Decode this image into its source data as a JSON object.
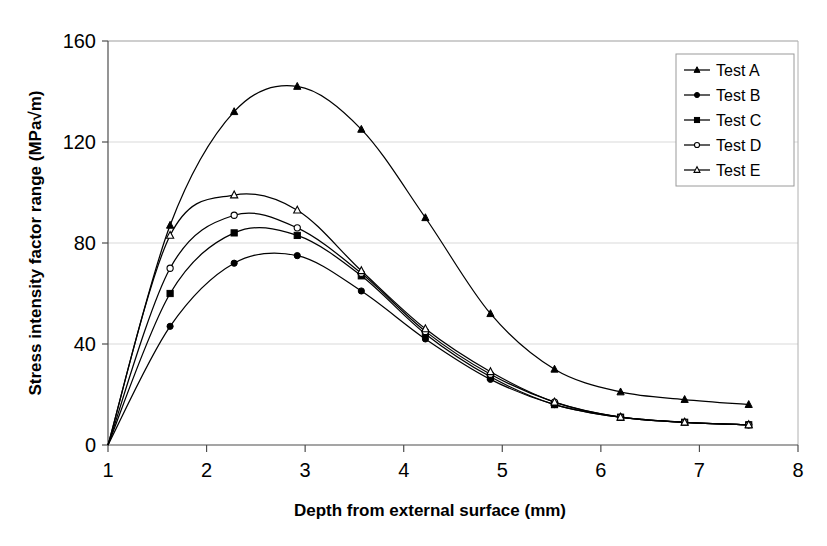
{
  "chart_data": {
    "type": "line",
    "title": "",
    "xlabel": "Depth from external surface (mm)",
    "ylabel": "Stress intensity factor range (MPa√m)",
    "xlim": [
      1,
      8
    ],
    "ylim": [
      0,
      160
    ],
    "xticks": [
      "1",
      "2",
      "3",
      "4",
      "5",
      "6",
      "7",
      "8"
    ],
    "yticks": [
      "0",
      "40",
      "80",
      "120",
      "160"
    ],
    "grid": "horizontal",
    "legend_position": "top-right",
    "x": [
      1.0,
      1.63,
      2.28,
      2.92,
      3.57,
      4.22,
      4.88,
      5.53,
      6.2,
      6.85,
      7.5
    ],
    "series": [
      {
        "name": "Test A",
        "marker": "filled-triangle",
        "values": [
          0,
          87,
          132,
          142,
          125,
          90,
          52,
          30,
          21,
          18,
          16
        ]
      },
      {
        "name": "Test B",
        "marker": "filled-circle",
        "values": [
          0,
          47,
          72,
          75,
          61,
          42,
          26,
          16,
          11,
          9,
          8
        ]
      },
      {
        "name": "Test C",
        "marker": "filled-square",
        "values": [
          0,
          60,
          84,
          83,
          67,
          44,
          27,
          16,
          11,
          9,
          8
        ]
      },
      {
        "name": "Test D",
        "marker": "open-circle",
        "values": [
          0,
          70,
          91,
          86,
          68,
          45,
          28,
          17,
          11,
          9,
          8
        ]
      },
      {
        "name": "Test E",
        "marker": "open-triangle",
        "values": [
          0,
          83,
          99,
          93,
          69,
          46,
          29,
          17,
          11,
          9,
          8
        ]
      }
    ]
  },
  "legend": {
    "items": [
      {
        "label": "Test A",
        "marker": "filled-triangle"
      },
      {
        "label": "Test B",
        "marker": "filled-circle"
      },
      {
        "label": "Test C",
        "marker": "filled-square"
      },
      {
        "label": "Test D",
        "marker": "open-circle"
      },
      {
        "label": "Test E",
        "marker": "open-triangle"
      }
    ]
  }
}
